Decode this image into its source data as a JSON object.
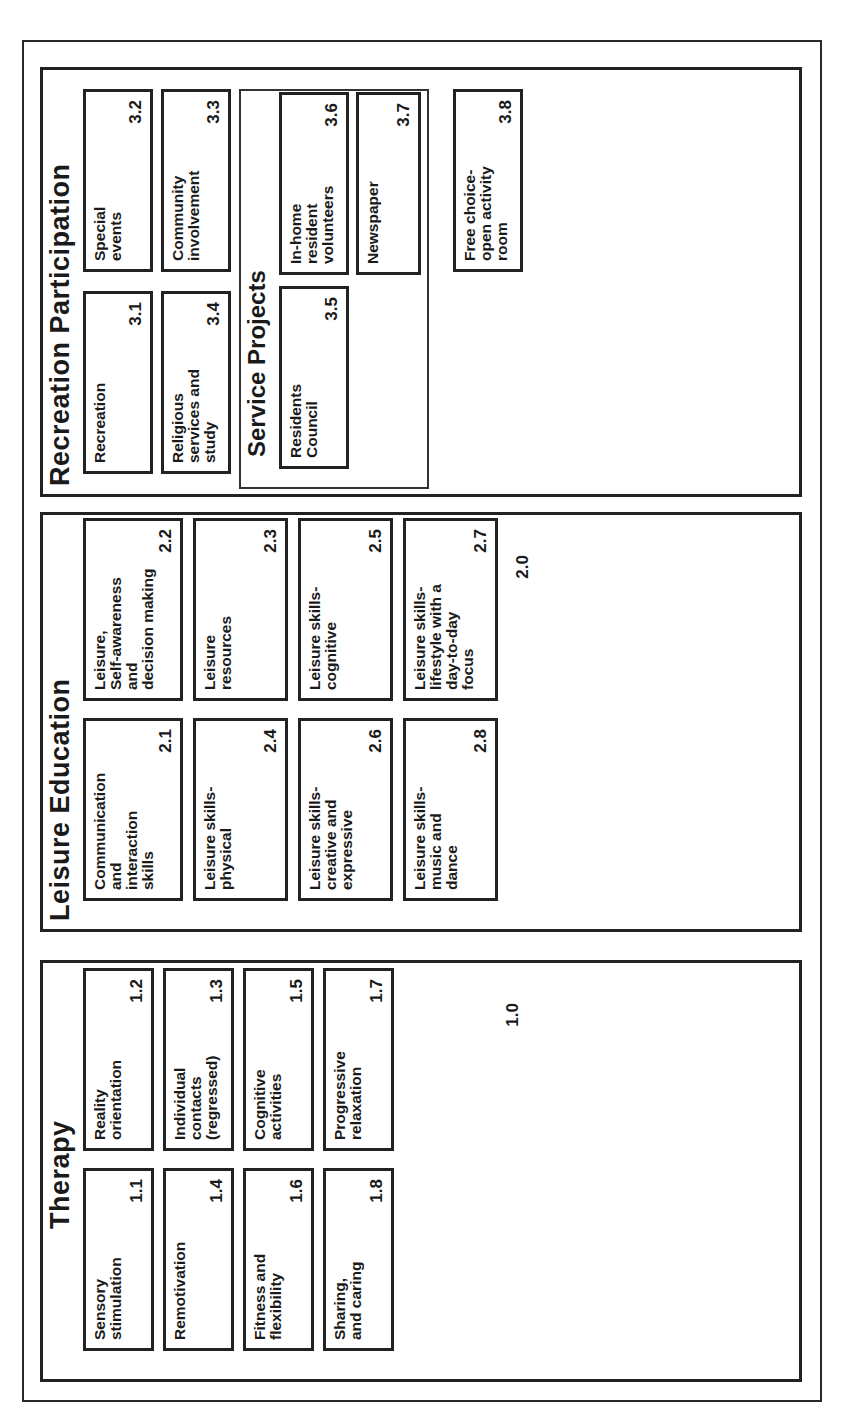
{
  "therapy": {
    "title": "Therapy",
    "number": "1.0",
    "items": [
      {
        "label": "Sensory\nstimulation",
        "number": "1.1"
      },
      {
        "label": "Reality\norientation",
        "number": "1.2"
      },
      {
        "label": "Remotivation",
        "number": "1.4"
      },
      {
        "label": "Individual\ncontacts\n(regressed)",
        "number": "1.3"
      },
      {
        "label": "Fitness and\nflexibility",
        "number": "1.6"
      },
      {
        "label": "Cognitive\nactivities",
        "number": "1.5"
      },
      {
        "label": "Sharing,\nand caring",
        "number": "1.8"
      },
      {
        "label": "Progressive\nrelaxation",
        "number": "1.7"
      }
    ]
  },
  "leisure_education": {
    "title": "Leisure Education",
    "number": "2.0",
    "items": [
      {
        "label": "Communication\nand\ninteraction\nskills",
        "number": "2.1"
      },
      {
        "label": "Leisure,\nSelf-awareness\nand\ndecision making",
        "number": "2.2"
      },
      {
        "label": "Leisure skills-\nphysical",
        "number": "2.4"
      },
      {
        "label": "Leisure\nresources",
        "number": "2.3"
      },
      {
        "label": "Leisure skills-\ncreative and\nexpressive",
        "number": "2.6"
      },
      {
        "label": "Leisure skills-\ncognitive",
        "number": "2.5"
      },
      {
        "label": "Leisure skills-\nmusic and\ndance",
        "number": "2.8"
      },
      {
        "label": "Leisure skills-\nlifestyle with a\nday-to-day\nfocus",
        "number": "2.7"
      }
    ]
  },
  "recreation_participation": {
    "title": "Recreation Participation",
    "items": [
      {
        "label": "Recreation",
        "number": "3.1"
      },
      {
        "label": "Special\nevents",
        "number": "3.2"
      },
      {
        "label": "Religious\nservices and\nstudy",
        "number": "3.4"
      },
      {
        "label": "Community\ninvolvement",
        "number": "3.3"
      },
      {
        "label": "Free choice-\nopen activity\nroom",
        "number": "3.8"
      }
    ],
    "service_projects": {
      "title": "Service Projects",
      "items": [
        {
          "label": "Residents\nCouncil",
          "number": "3.5"
        },
        {
          "label": "In-home\nresident\nvolunteers",
          "number": "3.6"
        },
        {
          "label": "Newspaper",
          "number": "3.7"
        }
      ]
    }
  }
}
